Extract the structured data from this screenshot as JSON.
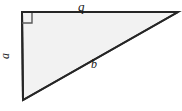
{
  "figure": {
    "type": "right-triangle-diagram",
    "background_color": "#ffffff",
    "fill_color": "#f2f2f2",
    "stroke_color": "#262626",
    "stroke_width": 2,
    "width": 182,
    "height": 111
  },
  "geometry": {
    "vertices": {
      "top_left": {
        "x": 22,
        "y": 12
      },
      "top_right": {
        "x": 178,
        "y": 12
      },
      "bottom_left": {
        "x": 23,
        "y": 100
      }
    },
    "right_angle_marker": {
      "at": "top_left",
      "size": 10,
      "stroke_color": "#555555"
    }
  },
  "labels": {
    "top_side": "q",
    "left_side": "a",
    "hypotenuse": "b"
  }
}
